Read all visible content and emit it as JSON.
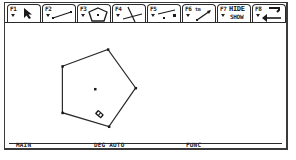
{
  "toolbar": {
    "tabs": [
      {
        "key": "F1",
        "icon": "pointer-arrow-icon"
      },
      {
        "key": "F2",
        "icon": "line-segment-icon"
      },
      {
        "key": "F3",
        "icon": "polygon-icon",
        "active": true
      },
      {
        "key": "F4",
        "icon": "perpendicular-lines-icon"
      },
      {
        "key": "F5",
        "icon": "point-on-segment-icon"
      },
      {
        "key": "F6",
        "sub": "tm",
        "icon": "measure-arrow-icon"
      },
      {
        "key": "F7",
        "line1": "HIDE",
        "line2": "SHOW"
      },
      {
        "key": "F8",
        "icon": "undo-arrow-icon"
      }
    ]
  },
  "canvas": {
    "shape": "regular-pentagon",
    "vertices": [
      [
        58,
        43
      ],
      [
        104,
        26
      ],
      [
        132,
        65
      ],
      [
        105,
        104
      ],
      [
        58,
        90
      ]
    ],
    "center": [
      91,
      66
    ],
    "cursor": "pencil-cursor-icon",
    "cursor_pos": [
      97,
      91
    ]
  },
  "status_bar": {
    "mode": "MAIN",
    "angle": "DEG AUTO",
    "graph": "FUNC"
  }
}
